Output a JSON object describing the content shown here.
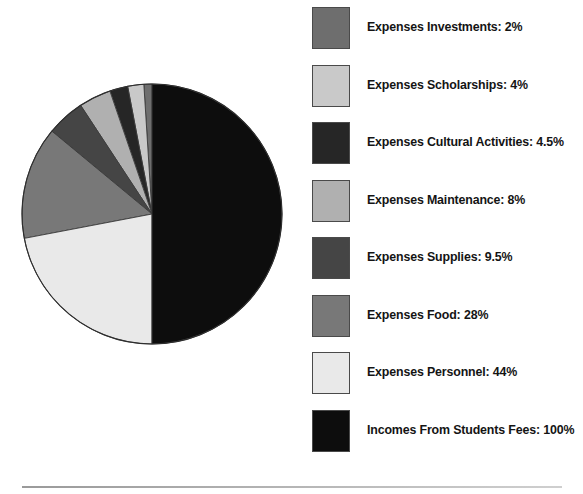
{
  "chart_data": {
    "type": "pie",
    "title": "",
    "subtitle": "",
    "xlabel": "",
    "ylabel": "",
    "legend_position": "right",
    "grid": false,
    "value_unit": "%",
    "categories": [
      "Expenses Investments",
      "Expenses Scholarships",
      "Expenses Cultural Activities",
      "Expenses Maintenance",
      "Expenses Supplies",
      "Expenses Food",
      "Expenses Personnel",
      "Incomes From Students Fees"
    ],
    "values": [
      2,
      4,
      4.5,
      8,
      9.5,
      28,
      44,
      100
    ],
    "colors": [
      "#6e6e6e",
      "#c9c9c9",
      "#262626",
      "#b0b0b0",
      "#454545",
      "#787878",
      "#e9e9e9",
      "#0d0d0d"
    ],
    "labels": [
      "Expenses Investments: 2%",
      "Expenses Scholarships: 4%",
      "Expenses Cultural Activities: 4.5%",
      "Expenses Maintenance: 8%",
      "Expenses Supplies: 9.5%",
      "Expenses Food: 28%",
      "Expenses Personnel: 44%",
      "Incomes From Students Fees: 100%"
    ]
  },
  "legend": {
    "items": [
      {
        "label": "Expenses Investments: 2%",
        "color": "#6e6e6e",
        "value": 2
      },
      {
        "label": "Expenses Scholarships: 4%",
        "color": "#c9c9c9",
        "value": 4
      },
      {
        "label": "Expenses Cultural Activities: 4.5%",
        "color": "#262626",
        "value": 4.5
      },
      {
        "label": "Expenses Maintenance: 8%",
        "color": "#b0b0b0",
        "value": 8
      },
      {
        "label": "Expenses Supplies: 9.5%",
        "color": "#454545",
        "value": 9.5
      },
      {
        "label": "Expenses Food: 28%",
        "color": "#787878",
        "value": 28
      },
      {
        "label": "Expenses Personnel: 44%",
        "color": "#e9e9e9",
        "value": 44
      },
      {
        "label": "Incomes From Students Fees: 100%",
        "color": "#0d0d0d",
        "value": 100
      }
    ]
  }
}
